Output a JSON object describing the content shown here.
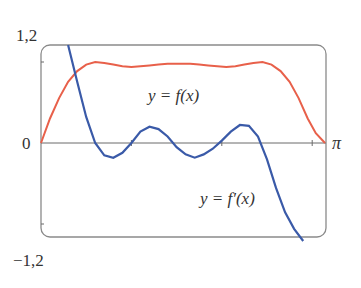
{
  "chart_data": {
    "type": "line",
    "title": "",
    "xlabel": "",
    "ylabel": "",
    "xlim": [
      0,
      3.14159
    ],
    "ylim": [
      -1.2,
      1.2
    ],
    "grid": false,
    "legend": "none",
    "y_tick_labels": {
      "top": "1,2",
      "zero": "0",
      "bottom": "−1,2"
    },
    "x_tick_labels": {
      "right": "π"
    },
    "x_ticks": [
      1,
      2,
      3
    ],
    "annotations": [
      {
        "text": "y = f(x)",
        "x": 1.55,
        "y": 0.62
      },
      {
        "text": "y = f′(x)",
        "x": 2.15,
        "y": -0.68
      }
    ],
    "series": [
      {
        "name": "y = f(x)",
        "color": "#e8604a",
        "x": [
          0,
          0.1,
          0.2,
          0.3,
          0.4,
          0.5,
          0.6,
          0.7,
          0.8,
          0.9,
          1.0,
          1.1,
          1.2,
          1.3,
          1.4,
          1.5,
          1.5708,
          1.65,
          1.75,
          1.85,
          1.95,
          2.05,
          2.15,
          2.25,
          2.35,
          2.45,
          2.55,
          2.65,
          2.75,
          2.85,
          2.95,
          3.04,
          3.14159
        ],
        "values": [
          0,
          0.3,
          0.55,
          0.75,
          0.88,
          0.96,
          0.99,
          0.98,
          0.96,
          0.94,
          0.93,
          0.94,
          0.95,
          0.96,
          0.97,
          0.97,
          0.97,
          0.97,
          0.96,
          0.95,
          0.94,
          0.93,
          0.94,
          0.96,
          0.98,
          0.99,
          0.96,
          0.88,
          0.75,
          0.55,
          0.3,
          0.12,
          0
        ]
      },
      {
        "name": "y = f′(x)",
        "color": "#3a5aa8",
        "x": [
          0.3,
          0.4,
          0.5,
          0.6,
          0.7,
          0.8,
          0.9,
          1.0,
          1.1,
          1.2,
          1.3,
          1.4,
          1.5,
          1.6,
          1.7,
          1.8,
          1.9,
          2.0,
          2.1,
          2.2,
          2.3,
          2.4,
          2.5,
          2.6,
          2.7,
          2.8,
          2.9
        ],
        "values": [
          1.2,
          0.75,
          0.32,
          0.0,
          -0.15,
          -0.18,
          -0.12,
          0.0,
          0.14,
          0.2,
          0.17,
          0.08,
          -0.05,
          -0.14,
          -0.18,
          -0.14,
          -0.07,
          0.03,
          0.14,
          0.22,
          0.21,
          0.08,
          -0.2,
          -0.55,
          -0.85,
          -1.05,
          -1.2
        ]
      }
    ]
  }
}
